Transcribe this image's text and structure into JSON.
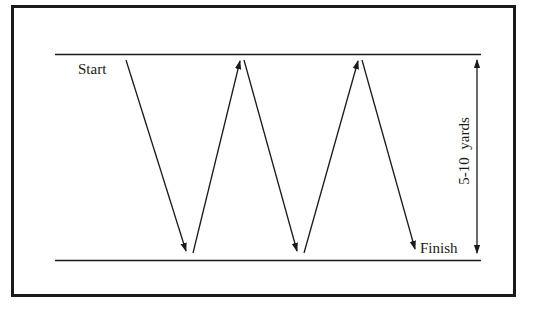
{
  "diagram": {
    "labels": {
      "start": "Start",
      "finish": "Finish",
      "distance": "5-10  yards"
    },
    "colors": {
      "ink": "#1a1a1a",
      "background": "#ffffff"
    },
    "path": {
      "description": "Zigzag running pattern between two parallel lines, 5 diagonal legs",
      "legs": 5
    }
  }
}
